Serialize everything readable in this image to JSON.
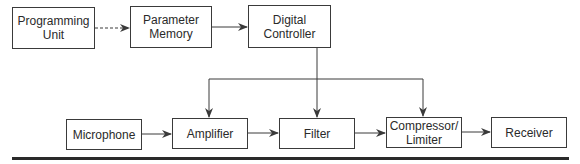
{
  "diagram": {
    "type": "block-diagram",
    "blocks": {
      "programming_unit": "Programming\nUnit",
      "parameter_memory": "Parameter\nMemory",
      "digital_controller": "Digital\nController",
      "microphone": "Microphone",
      "amplifier": "Amplifier",
      "filter": "Filter",
      "compressor_limiter": "Compressor/\nLimiter",
      "receiver": "Receiver"
    },
    "edges": [
      {
        "from": "Programming Unit",
        "to": "Parameter Memory",
        "style": "dashed"
      },
      {
        "from": "Parameter Memory",
        "to": "Digital Controller",
        "style": "solid"
      },
      {
        "from": "Digital Controller",
        "to": "Amplifier",
        "style": "solid"
      },
      {
        "from": "Digital Controller",
        "to": "Filter",
        "style": "solid"
      },
      {
        "from": "Digital Controller",
        "to": "Compressor/Limiter",
        "style": "solid"
      },
      {
        "from": "Microphone",
        "to": "Amplifier",
        "style": "solid"
      },
      {
        "from": "Amplifier",
        "to": "Filter",
        "style": "solid"
      },
      {
        "from": "Filter",
        "to": "Compressor/Limiter",
        "style": "solid"
      },
      {
        "from": "Compressor/Limiter",
        "to": "Receiver",
        "style": "solid"
      }
    ],
    "colors": {
      "line": "#3a3a3a",
      "text": "#2a2a2a",
      "background": "#ffffff"
    }
  }
}
